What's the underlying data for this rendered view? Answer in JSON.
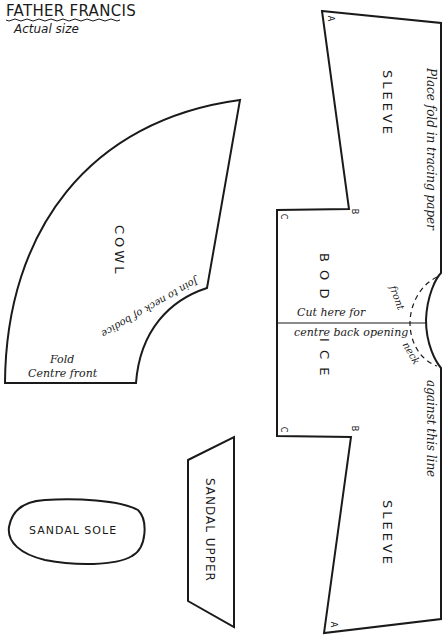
{
  "header": {
    "title": "FATHER FRANCIS",
    "subtitle": "Actual size"
  },
  "pieces": {
    "sleeve_top": {
      "label": "SLEEVE"
    },
    "sleeve_bottom": {
      "label": "SLEEVE"
    },
    "bodice": {
      "label_part1": "B O D",
      "label_part2": "I C E",
      "cut_line_text1": "Cut here for",
      "cut_line_text2": "centre back opening",
      "neck_front": "front",
      "neck_back": "neck"
    },
    "cowl": {
      "label": "COWL",
      "join_text": "Join to neck of bodice",
      "fold_text1": "Fold",
      "fold_text2": "Centre front"
    },
    "sandal_sole": {
      "label": "SANDAL SOLE"
    },
    "sandal_upper": {
      "label": "SANDAL UPPER"
    }
  },
  "fold_line": {
    "text_top": "Place fold in tracing paper",
    "text_bottom": "against this line"
  },
  "corner_marks": {
    "a": "A",
    "b": "B",
    "c": "C"
  },
  "colors": {
    "line": "#1a1a1a",
    "background": "#ffffff"
  }
}
